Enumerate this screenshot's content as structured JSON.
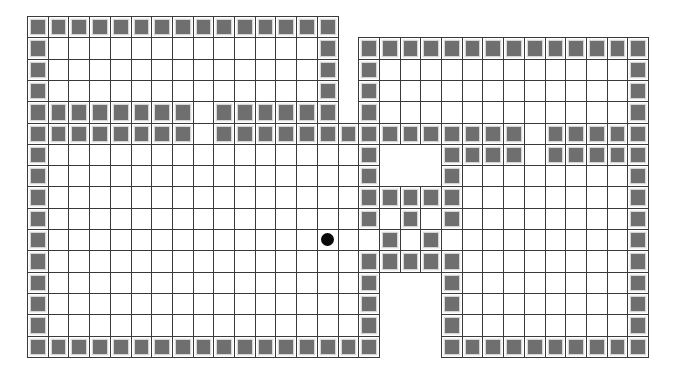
{
  "board": {
    "origin_x": 27,
    "origin_y": 16,
    "cell_w": 20.7,
    "cell_h": 21.3,
    "cols": 30,
    "rows_count": 16,
    "legend": {
      "#": "wall",
      ".": "floor",
      " ": "void"
    },
    "colors": {
      "grid_line": "#3a3a3a",
      "wall_fill": "#6f6f6f",
      "wall_border": "#d6d6d6",
      "floor": "#ffffff",
      "agent": "#0a0a0a"
    },
    "rows": [
      "###############               ",
      "#.............# ##############",
      "#.............# #............#",
      "#.............# #............#",
      "########.###### #............#",
      "########.###############.#####",
      "#...............#   ####.#####",
      "#...............#   #........#",
      "#...............#####........#",
      "#...............#.#.#........#",
      "#................#.#.........#",
      "#...............#####........#",
      "#...............#   #........#",
      "#...............#   #........#",
      "#...............#   #........#",
      "#################   ##########"
    ]
  },
  "agent": {
    "label": "agent-position",
    "col": 14,
    "row": 10
  }
}
